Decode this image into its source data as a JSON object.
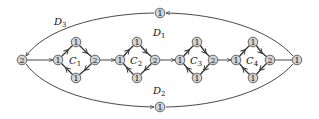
{
  "diagram": {
    "type": "directed-graph",
    "colors": {
      "node_fill": "#d4d4d4",
      "node_stroke": "#444444",
      "edge": "#333333",
      "background": "#ffffff"
    },
    "nodes": {
      "source": {
        "label": "2",
        "x": 22,
        "y": 60
      },
      "sink": {
        "label": "1",
        "x": 297,
        "y": 60
      },
      "top_mid": {
        "label": "1",
        "x": 160,
        "y": 13
      },
      "bottom_mid": {
        "label": "1",
        "x": 160,
        "y": 107
      }
    },
    "gadgets": [
      {
        "name": "C",
        "sub": "1",
        "left": {
          "label": "1",
          "x": 58,
          "y": 60
        },
        "top": {
          "label": "1",
          "x": 76,
          "y": 42
        },
        "right": {
          "label": "2",
          "x": 95,
          "y": 60
        },
        "bottom": {
          "label": "1",
          "x": 76,
          "y": 78
        }
      },
      {
        "name": "C",
        "sub": "2",
        "left": {
          "label": "1",
          "x": 120,
          "y": 60
        },
        "top": {
          "label": "1",
          "x": 137,
          "y": 42
        },
        "right": {
          "label": "2",
          "x": 155,
          "y": 60
        },
        "bottom": {
          "label": "1",
          "x": 137,
          "y": 78
        }
      },
      {
        "name": "C",
        "sub": "3",
        "left": {
          "label": "1",
          "x": 180,
          "y": 60
        },
        "top": {
          "label": "1",
          "x": 197,
          "y": 42
        },
        "right": {
          "label": "2",
          "x": 213,
          "y": 60
        },
        "bottom": {
          "label": "1",
          "x": 197,
          "y": 78
        }
      },
      {
        "name": "C",
        "sub": "4",
        "left": {
          "label": "1",
          "x": 236,
          "y": 60
        },
        "top": {
          "label": "1",
          "x": 253,
          "y": 42
        },
        "right": {
          "label": "2",
          "x": 270,
          "y": 60
        },
        "bottom": {
          "label": "1",
          "x": 253,
          "y": 78
        }
      }
    ],
    "path_labels": [
      {
        "name": "D",
        "sub": "3",
        "x": 54,
        "y": 22
      },
      {
        "name": "D",
        "sub": "1",
        "x": 154,
        "y": 34
      },
      {
        "name": "D",
        "sub": "2",
        "x": 154,
        "y": 92
      }
    ]
  }
}
